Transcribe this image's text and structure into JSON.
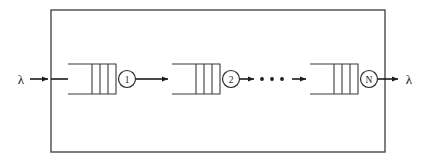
{
  "figure": {
    "type": "queueing-network-diagram",
    "background_color": "#ffffff",
    "line_color": "#3a3a3a",
    "frame_color": "#4a4a4a",
    "arrow_color": "#1c1c1c",
    "text_color": "#1c1c1c"
  },
  "system_boundary": {
    "name": "system-boundary-box",
    "x": 51,
    "y": 10,
    "width": 334,
    "height": 142
  },
  "arrival": {
    "label": "λ",
    "name": "arrival-rate-lambda"
  },
  "departure": {
    "label": "λ",
    "name": "departure-rate-lambda"
  },
  "stages": [
    {
      "index": 1,
      "server_label": "1",
      "queue_x": 68,
      "queue_width": 48,
      "server_cx": 127,
      "slots": 3
    },
    {
      "index": 2,
      "server_label": "2",
      "queue_x": 172,
      "queue_width": 48,
      "server_cx": 231,
      "slots": 3
    },
    {
      "index": 3,
      "server_label": "N",
      "queue_x": 310,
      "queue_width": 48,
      "server_cx": 369,
      "slots": 3
    }
  ],
  "ellipsis": {
    "name": "continuation-ellipsis",
    "label": "• • •",
    "dot_count": 3,
    "dots_x": [
      262,
      272,
      282
    ],
    "dots_y": 79,
    "dot_radius": 1.9
  },
  "geometry": {
    "axis_y": 79,
    "queue_top_y": 64,
    "queue_bottom_y": 94,
    "server_radius": 8.5
  }
}
